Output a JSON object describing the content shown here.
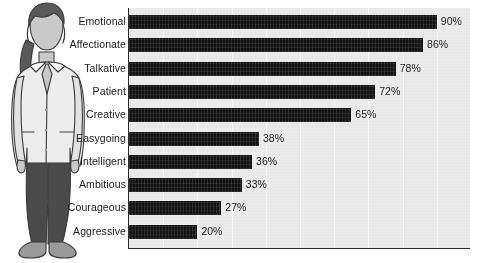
{
  "chart_data": {
    "type": "bar",
    "orientation": "horizontal",
    "title": "",
    "xlabel": "",
    "ylabel": "",
    "xlim": [
      0,
      100
    ],
    "grid": true,
    "legend": "none",
    "unit": "%",
    "categories": [
      "Emotional",
      "Affectionate",
      "Talkative",
      "Patient",
      "Creative",
      "Easygoing",
      "Intelligent",
      "Ambitious",
      "Courageous",
      "Aggressive"
    ],
    "values": [
      90,
      86,
      78,
      72,
      65,
      38,
      36,
      33,
      27,
      20
    ],
    "value_labels": [
      "90%",
      "86%",
      "78%",
      "72%",
      "65%",
      "38%",
      "36%",
      "33%",
      "27%",
      "20%"
    ],
    "bar_color": "#121212",
    "plot_background": "#ebebeb",
    "axis_color": "#2b2b2b",
    "gridline_color": "#f7f7f7",
    "gridline_step": 10
  },
  "illustration": {
    "name": "woman-in-lab-coat-illustration",
    "description": "Line-art drawing of a standing woman wearing a white lab coat over dark trousers",
    "colors": {
      "hair": "#5a5a5a",
      "skin": "#c9c9c9",
      "coat": "#ededed",
      "coat_shadow": "#d3d3d3",
      "pants": "#4a4a4a",
      "shoes": "#9a9a9a",
      "outline": "#3a3a3a",
      "background": "#ffffff"
    }
  },
  "page": {
    "background": "#ffffff"
  }
}
